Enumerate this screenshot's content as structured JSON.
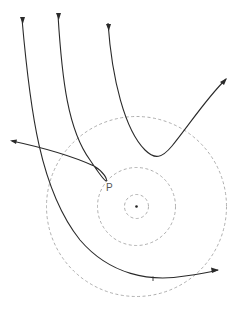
{
  "diagram": {
    "labels": {
      "point_p": "P"
    },
    "orbits": [
      {
        "name": "inner-orbit"
      },
      {
        "name": "middle-orbit"
      },
      {
        "name": "outer-orbit"
      }
    ],
    "trajectories": [
      {
        "name": "trajectory-1",
        "description": "deflected, passes around and exits right"
      },
      {
        "name": "trajectory-2",
        "description": "loops near point P and exits left"
      },
      {
        "name": "trajectory-3",
        "description": "shallow deflection, exits upper right"
      }
    ]
  }
}
